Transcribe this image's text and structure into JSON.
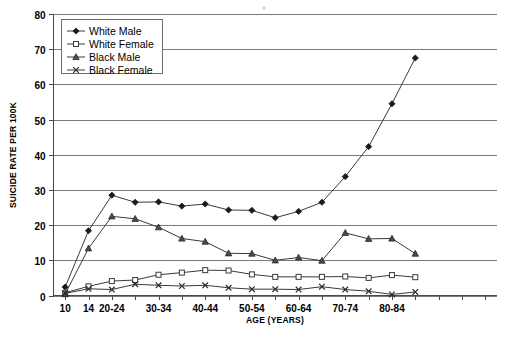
{
  "chart_data": {
    "type": "line",
    "title": "",
    "xlabel": "AGE (YEARS)",
    "ylabel": "SUICIDE RATE PER 100K",
    "ylim": [
      0,
      80
    ],
    "yticks": [
      0,
      10,
      20,
      30,
      40,
      50,
      60,
      70,
      80
    ],
    "grid": true,
    "legend_position": "top-left",
    "x": [
      "10-14",
      "15-19",
      "20-24",
      "25-29",
      "30-34",
      "35-39",
      "40-44",
      "45-49",
      "50-54",
      "55-59",
      "60-64",
      "65-69",
      "70-74",
      "75-79",
      "80-84",
      "85+"
    ],
    "xtick_labels": [
      "10",
      "14",
      "20-24",
      "",
      "30-34",
      "",
      "40-44",
      "",
      "50-54",
      "",
      "60-64",
      "",
      "70-74",
      "",
      "80-84",
      ""
    ],
    "series": [
      {
        "name": "White Male",
        "marker": "filled-diamond",
        "values": [
          2.4,
          18.4,
          28.5,
          26.5,
          26.6,
          25.4,
          26.0,
          24.3,
          24.2,
          22.1,
          23.9,
          26.5,
          33.8,
          42.3,
          54.5,
          67.5
        ]
      },
      {
        "name": "White Female",
        "marker": "open-square",
        "values": [
          0.8,
          2.6,
          4.1,
          4.4,
          5.9,
          6.5,
          7.2,
          7.1,
          6.0,
          5.3,
          5.3,
          5.3,
          5.4,
          5.0,
          5.8,
          5.2
        ]
      },
      {
        "name": "Black Male",
        "marker": "filled-triangle",
        "values": [
          0.4,
          13.4,
          22.5,
          21.8,
          19.4,
          16.2,
          15.3,
          12.0,
          11.9,
          10.0,
          10.8,
          9.9,
          17.8,
          16.1,
          16.2,
          11.9
        ]
      },
      {
        "name": "Black Female",
        "marker": "x-cross",
        "values": [
          0.6,
          1.9,
          1.7,
          3.2,
          2.9,
          2.7,
          2.9,
          2.2,
          1.8,
          1.8,
          1.7,
          2.5,
          1.7,
          1.2,
          0.3,
          1.0
        ]
      }
    ]
  },
  "legend": {
    "items": [
      {
        "label": "White Male"
      },
      {
        "label": "White Female"
      },
      {
        "label": "Black Male"
      },
      {
        "label": "Black Female"
      }
    ]
  },
  "axes": {
    "y_title": "SUICIDE RATE PER 100K",
    "x_title": "AGE (YEARS)"
  }
}
